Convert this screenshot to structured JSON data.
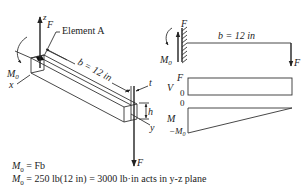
{
  "figure": {
    "left_view": {
      "axis_labels": {
        "z": "z",
        "x": "x",
        "y": "y"
      },
      "force_top_label": "F",
      "force_bottom_label": "F",
      "moment_label": "M",
      "moment_subscript": "0",
      "element_label": "Element A",
      "length_label": "b = 12 in",
      "thickness_label": "t",
      "height_label": "h"
    },
    "right_view": {
      "beam": {
        "force_left_label": "F",
        "moment_label": "M",
        "moment_subscript": "0",
        "length_label": "b = 12 in",
        "force_right_label": "F"
      },
      "shear_diagram": {
        "axis_label": "V",
        "top_value": "F",
        "bottom_value": "0"
      },
      "moment_diagram": {
        "axis_label": "M",
        "top_value": "0",
        "bottom_value_prefix": "−M",
        "bottom_value_subscript": "0"
      }
    },
    "equations": [
      {
        "lhs": "M",
        "sub": "0",
        "rhs": " = Fb"
      },
      {
        "lhs": "M",
        "sub": "0",
        "rhs": " = 250 lb(12 in) = 3000 lb·in acts in y-z plane"
      }
    ]
  }
}
